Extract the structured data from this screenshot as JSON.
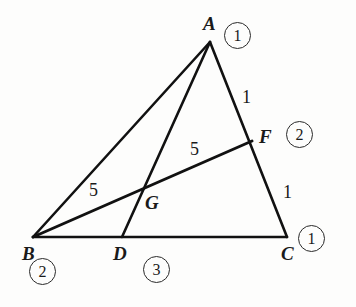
{
  "figure": {
    "kind": "geometry-diagram",
    "stroke_color": "#111111",
    "background_color": "#fdfdfc",
    "canvas": {
      "width": 356,
      "height": 307
    }
  },
  "points": {
    "A": {
      "label": "A",
      "x": 210,
      "y": 42
    },
    "B": {
      "label": "B",
      "x": 33,
      "y": 237
    },
    "C": {
      "label": "C",
      "x": 287,
      "y": 237
    },
    "D": {
      "label": "D",
      "x": 122,
      "y": 237
    },
    "F": {
      "label": "F",
      "x": 252,
      "y": 141
    },
    "G": {
      "label": "G",
      "x": 140,
      "y": 192
    }
  },
  "point_labels": [
    {
      "name": "point-label-a",
      "text": "A",
      "x": 203,
      "y": 14
    },
    {
      "name": "point-label-b",
      "text": "B",
      "x": 22,
      "y": 244
    },
    {
      "name": "point-label-c",
      "text": "C",
      "x": 281,
      "y": 244
    },
    {
      "name": "point-label-d",
      "text": "D",
      "x": 113,
      "y": 244
    },
    {
      "name": "point-label-f",
      "text": "F",
      "x": 259,
      "y": 127
    },
    {
      "name": "point-label-g",
      "text": "G",
      "x": 145,
      "y": 193
    }
  ],
  "segment_lengths": [
    {
      "name": "length-label-bg",
      "text": "5",
      "x": 89,
      "y": 181
    },
    {
      "name": "length-label-gf",
      "text": "5",
      "x": 190,
      "y": 140
    },
    {
      "name": "length-label-af",
      "text": "1",
      "x": 242,
      "y": 88
    },
    {
      "name": "length-label-fc",
      "text": "1",
      "x": 283,
      "y": 183
    }
  ],
  "circled_numbers": [
    {
      "name": "circled-number-a",
      "text": "1",
      "x": 224,
      "y": 22
    },
    {
      "name": "circled-number-f",
      "text": "2",
      "x": 286,
      "y": 121
    },
    {
      "name": "circled-number-c",
      "text": "1",
      "x": 298,
      "y": 225
    },
    {
      "name": "circled-number-b",
      "text": "2",
      "x": 29,
      "y": 258
    },
    {
      "name": "circled-number-d",
      "text": "3",
      "x": 143,
      "y": 256
    }
  ],
  "segments": [
    {
      "name": "segment-ab",
      "from": "A",
      "to": "B",
      "width": 2.6
    },
    {
      "name": "segment-ac",
      "from": "A",
      "to": "C",
      "width": 2.6
    },
    {
      "name": "segment-bc",
      "from": "B",
      "to": "C",
      "width": 2.6
    },
    {
      "name": "segment-ad",
      "from": "A",
      "to": "D",
      "width": 2.6
    },
    {
      "name": "segment-bf",
      "from": "B",
      "to": "F",
      "width": 3.0
    }
  ]
}
